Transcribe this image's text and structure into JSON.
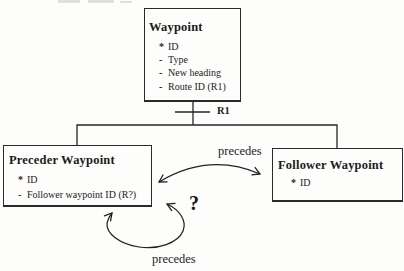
{
  "diagram": {
    "entities": [
      {
        "title": "Waypoint",
        "attributes": [
          {
            "bullet": "*",
            "text": "ID"
          },
          {
            "bullet": "-",
            "text": "Type"
          },
          {
            "bullet": "-",
            "text": "New heading"
          },
          {
            "bullet": "-",
            "text": "Route ID (R1)"
          }
        ]
      },
      {
        "title": "Preceder Waypoint",
        "attributes": [
          {
            "bullet": "*",
            "text": "ID"
          },
          {
            "bullet": "-",
            "text": "Follower waypoint ID (R?)"
          }
        ]
      },
      {
        "title": "Follower Waypoint",
        "attributes": [
          {
            "bullet": "*",
            "text": "ID"
          }
        ]
      }
    ],
    "labels": {
      "route_relationship": "R1",
      "precedes_top": "precedes",
      "precedes_bottom": "precedes",
      "uncertainty": "?"
    },
    "colors": {
      "ink": "#1e1e1e",
      "paper": "#fdfdfc",
      "box_border": "#2a2a2a"
    }
  }
}
